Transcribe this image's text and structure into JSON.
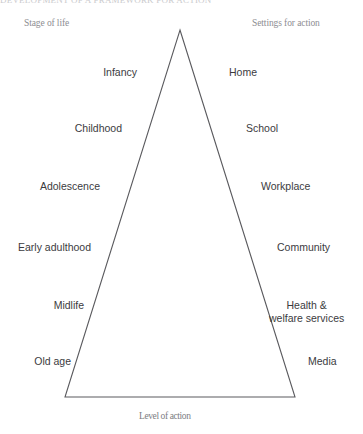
{
  "figure": {
    "clipped_title": "DEVELOPMENT OF A FRAMEWORK FOR ACTION",
    "caption": "Level of action",
    "line_color": "#5a5a5e",
    "text_color": "#3b3b3e",
    "header_color": "#8d8d92",
    "background": "#ffffff"
  },
  "headers": {
    "left": "Stage of life",
    "right": "Settings for action"
  },
  "triangle": {
    "apex": {
      "x": 180,
      "y": 30
    },
    "base_left": {
      "x": 65,
      "y": 397
    },
    "base_right": {
      "x": 295,
      "y": 397
    }
  },
  "rows": [
    {
      "stage": "Infancy",
      "setting": "Home",
      "y": 66,
      "stage_x": 137,
      "setting_x": 229
    },
    {
      "stage": "Childhood",
      "setting": "School",
      "y": 122,
      "stage_x": 122,
      "setting_x": 246
    },
    {
      "stage": "Adolescence",
      "setting": "Workplace",
      "y": 180,
      "stage_x": 100,
      "setting_x": 261
    },
    {
      "stage": "Early adulthood",
      "setting": "Community",
      "y": 241,
      "stage_x": 91,
      "setting_x": 277
    },
    {
      "stage": "Midlife",
      "setting": "Health &\nwelfare services",
      "y": 299,
      "stage_x": 84,
      "setting_x": 296
    },
    {
      "stage": "Old age",
      "setting": "Media",
      "y": 355,
      "stage_x": 71,
      "setting_x": 308
    }
  ],
  "labels": {
    "stage_0": "Infancy",
    "stage_1": "Childhood",
    "stage_2": "Adolescence",
    "stage_3": "Early adulthood",
    "stage_4": "Midlife",
    "stage_5": "Old age",
    "setting_0": "Home",
    "setting_1": "School",
    "setting_2": "Workplace",
    "setting_3": "Community",
    "setting_4_line1": "Health &",
    "setting_4_line2": "welfare services",
    "setting_5": "Media"
  }
}
